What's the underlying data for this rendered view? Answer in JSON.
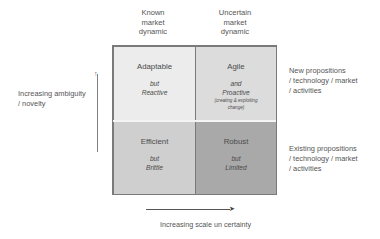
{
  "columns": [
    {
      "lines": [
        "Known",
        "market",
        "dynamic"
      ]
    },
    {
      "lines": [
        "Uncertain",
        "market",
        "dynamic"
      ]
    }
  ],
  "quadrants": {
    "top_left": {
      "title": "Adaptable",
      "connector": "but",
      "quality": "Reactive"
    },
    "top_right": {
      "title": "Agile",
      "connector": "and",
      "quality": "Proactive",
      "note_line1": "(creating & exploiting",
      "note_line2": "change)"
    },
    "bottom_left": {
      "title": "Efficient",
      "connector": "but",
      "quality": "Brittle"
    },
    "bottom_right": {
      "title": "Robust",
      "connector": "but",
      "quality": "Limited"
    }
  },
  "rows": [
    {
      "lines": [
        "New propositions",
        "/ technology / market",
        "/ activities"
      ]
    },
    {
      "lines": [
        "Existing propositions",
        "/ technology / market",
        "/ activities"
      ]
    }
  ],
  "y_axis": {
    "lines": [
      "Increasing ambiguity",
      "/ novelty"
    ],
    "arrow": "up-arrow"
  },
  "x_axis": {
    "label": "Increasing scale un certainty",
    "arrow": "right-arrow"
  },
  "colors": {
    "top_left": "#ececec",
    "top_right": "#dcdcdc",
    "bottom_left": "#cfcfcf",
    "bottom_right": "#a9a9a9",
    "border": "#7a7a7a"
  }
}
